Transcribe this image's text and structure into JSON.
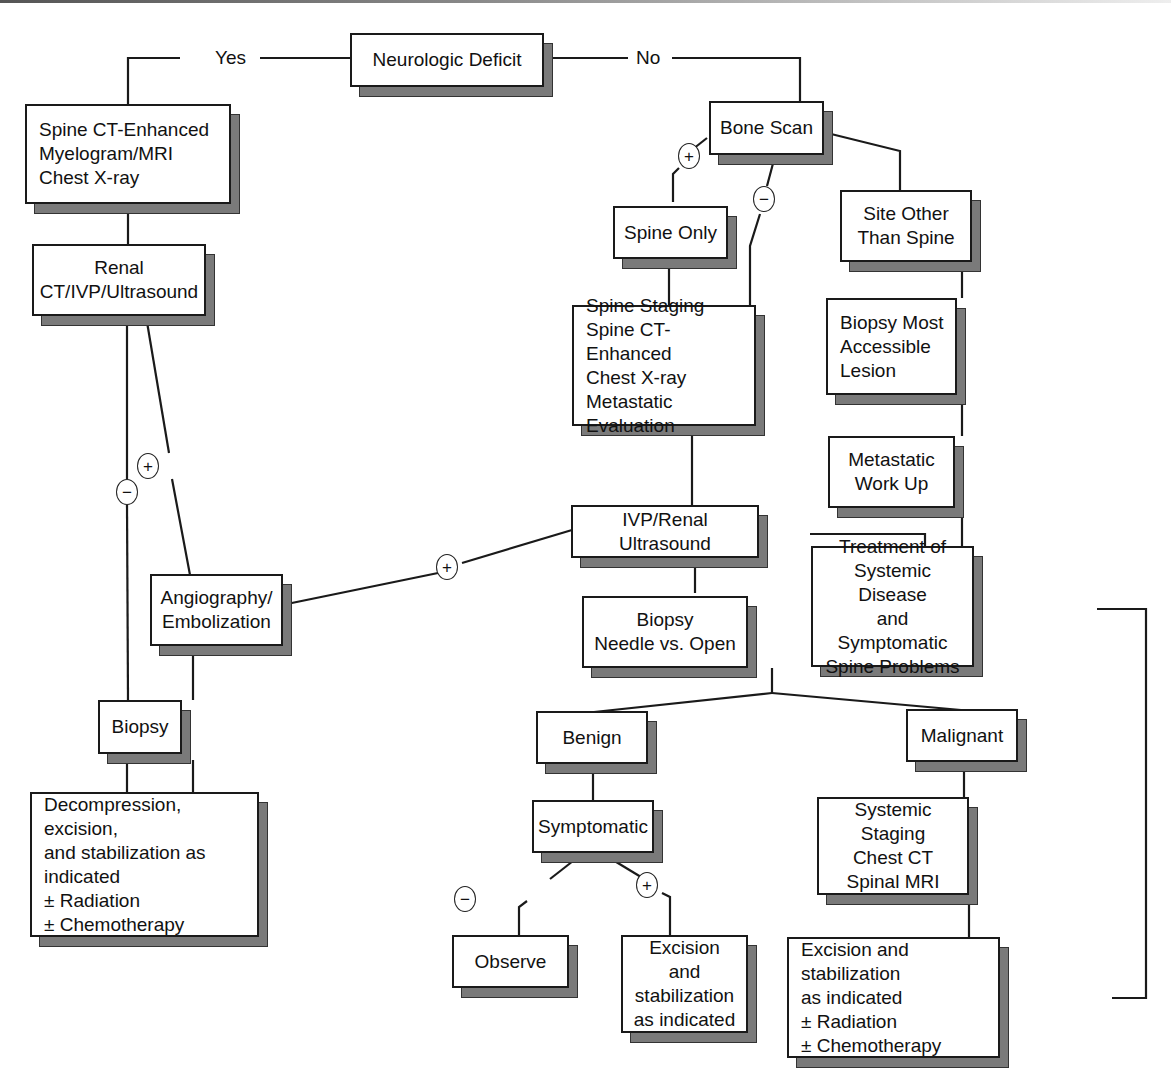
{
  "nodes": {
    "neurologic_deficit": "Neurologic Deficit",
    "spine_ct_left": "Spine CT-Enhanced\nMyelogram/MRI\nChest X-ray",
    "renal_ct": "Renal\nCT/IVP/Ultrasound",
    "angiography": "Angiography/\nEmbolization",
    "biopsy_left": "Biopsy",
    "decompression": "Decompression, excision,\nand stabilization as\nindicated\n± Radiation\n± Chemotherapy",
    "bone_scan": "Bone Scan",
    "spine_only": "Spine Only",
    "site_other": "Site Other\nThan Spine",
    "spine_staging": "Spine Staging\nSpine CT-Enhanced\nChest X-ray\nMetastatic Evaluation",
    "biopsy_accessible": "Biopsy Most\nAccessible\nLesion",
    "metastatic_workup": "Metastatic\nWork Up",
    "ivp_renal": "IVP/Renal Ultrasound",
    "treatment_systemic": "Treatment of\nSystemic Disease\nand Symptomatic\nSpine Problems",
    "biopsy_needle": "Biopsy\nNeedle vs. Open",
    "benign": "Benign",
    "malignant": "Malignant",
    "symptomatic": "Symptomatic",
    "systemic_staging": "Systemic Staging\nChest CT\nSpinal MRI",
    "observe": "Observe",
    "excision_benign": "Excision and\nstabilization\nas indicated",
    "excision_malignant": "Excision and stabilization\nas indicated\n± Radiation\n± Chemotherapy"
  },
  "edge_labels": {
    "yes": "Yes",
    "no": "No",
    "plus": "+",
    "minus": "−"
  }
}
